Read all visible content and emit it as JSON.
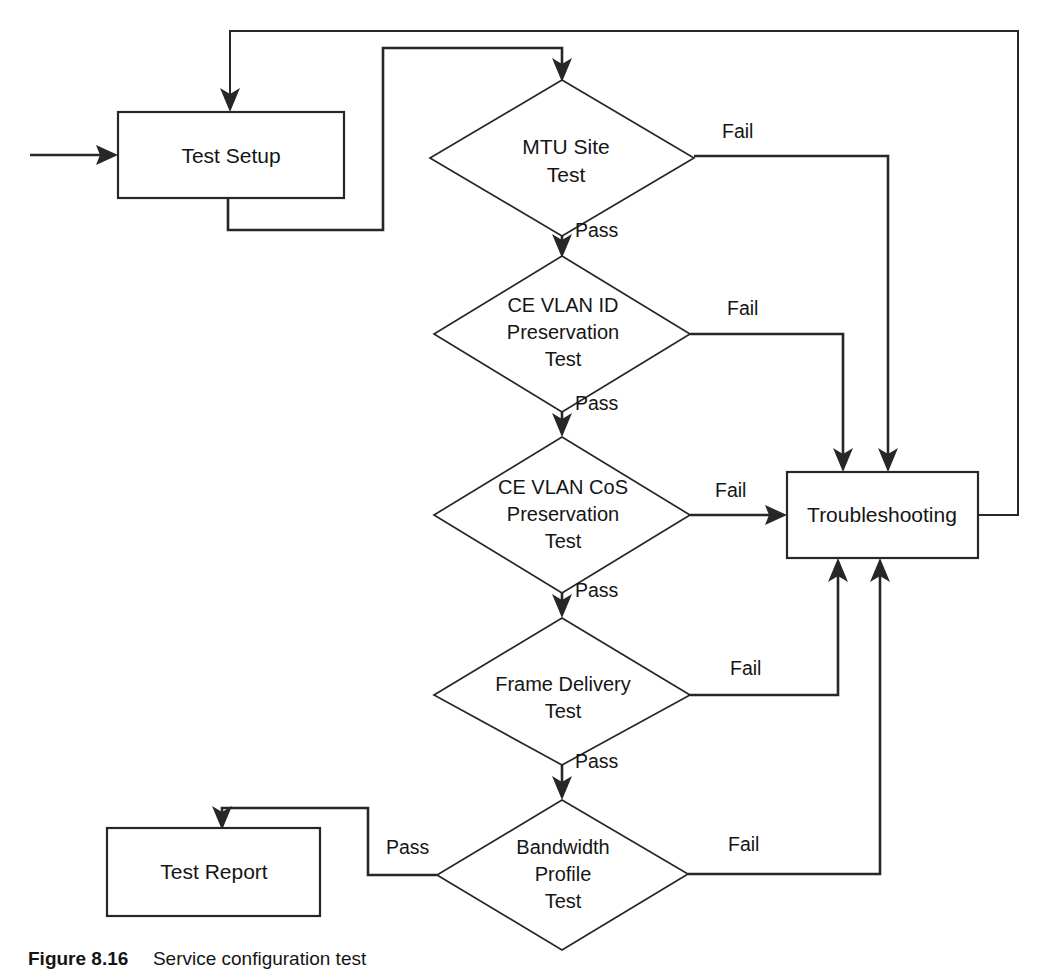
{
  "diagram": {
    "type": "flowchart",
    "background_color": "#ffffff",
    "line_color": "#272727",
    "text_color": "#151515"
  },
  "nodes": {
    "test_setup": {
      "label": "Test Setup",
      "shape": "process"
    },
    "mtu_site_test": {
      "line1": "MTU Site",
      "line2": "Test",
      "shape": "decision"
    },
    "ce_vlan_id_test": {
      "line1": "CE VLAN ID",
      "line2": "Preservation",
      "line3": "Test",
      "shape": "decision"
    },
    "ce_vlan_cos_test": {
      "line1": "CE VLAN CoS",
      "line2": "Preservation",
      "line3": "Test",
      "shape": "decision"
    },
    "frame_delivery_test": {
      "line1": "Frame Delivery",
      "line2": "Test",
      "shape": "decision"
    },
    "bandwidth_profile_test": {
      "line1": "Bandwidth",
      "line2": "Profile",
      "line3": "Test",
      "shape": "decision"
    },
    "troubleshooting": {
      "label": "Troubleshooting",
      "shape": "process"
    },
    "test_report": {
      "label": "Test Report",
      "shape": "process"
    }
  },
  "edge_labels": {
    "mtu_fail": "Fail",
    "mtu_pass": "Pass",
    "vlan_id_fail": "Fail",
    "vlan_id_pass": "Pass",
    "vlan_cos_fail": "Fail",
    "vlan_cos_pass": "Pass",
    "frame_fail": "Fail",
    "frame_pass": "Pass",
    "bandwidth_fail": "Fail",
    "bandwidth_pass": "Pass"
  },
  "caption": {
    "number": "Figure 8.16",
    "text": "Service configuration test"
  }
}
